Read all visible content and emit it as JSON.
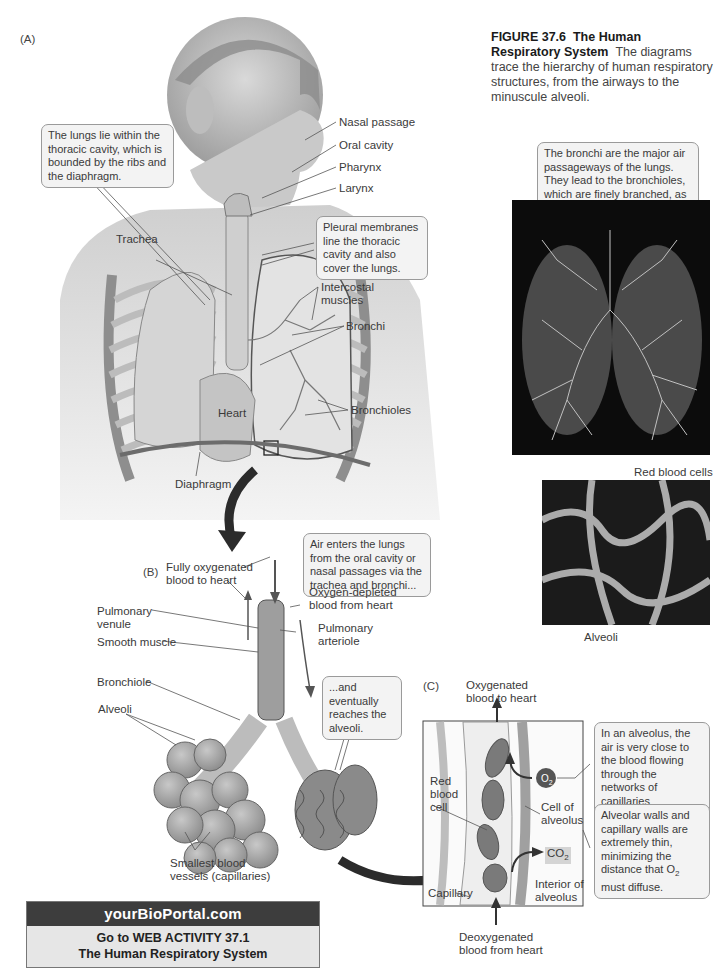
{
  "figure": {
    "number": "FIGURE 37.6",
    "title": "The Human Respiratory System",
    "caption": "The diagrams trace the hierarchy of human respiratory structures, from the airways to the minuscule alveoli."
  },
  "panels": {
    "a": {
      "letter": "(A)",
      "labels": {
        "nasal_passage": "Nasal passage",
        "oral_cavity": "Oral cavity",
        "pharynx": "Pharynx",
        "larynx": "Larynx",
        "trachea": "Trachea",
        "intercostal_1": "Intercostal",
        "intercostal_2": "muscles",
        "bronchi": "Bronchi",
        "heart": "Heart",
        "bronchioles": "Bronchioles",
        "diaphragm": "Diaphragm"
      },
      "callouts": {
        "thoracic": "The lungs lie within the thoracic cavity, which is bounded by the ribs and the diaphragm.",
        "pleural": "Pleural membranes line the thoracic cavity and also cover the lungs."
      }
    },
    "photos": {
      "bronchi_callout": "The bronchi are the major air passageways of the lungs. They lead to the bronchioles, which are finely branched, as are the blood vessels.",
      "red_blood_cells": "Red blood cells",
      "alveoli": "Alveoli"
    },
    "b": {
      "letter": "(B)",
      "labels": {
        "fully_oxy_1": "Fully oxygenated",
        "fully_oxy_2": "blood to heart",
        "oxy_depleted_1": "Oxygen-depleted",
        "oxy_depleted_2": "blood from heart",
        "pulm_venule_1": "Pulmonary",
        "pulm_venule_2": "venule",
        "pulm_arteriole_1": "Pulmonary",
        "pulm_arteriole_2": "arteriole",
        "smooth_muscle": "Smooth muscle",
        "bronchiole": "Bronchiole",
        "alveoli": "Alveoli",
        "smallest_1": "Smallest blood",
        "smallest_2": "vessels (capillaries)"
      },
      "callouts": {
        "air_enters": "Air enters the lungs from the oral cavity or nasal passages via the trachea and bronchi...",
        "eventually": "...and eventually reaches the alveoli."
      }
    },
    "c": {
      "letter": "(C)",
      "labels": {
        "oxygenated_1": "Oxygenated",
        "oxygenated_2": "blood to heart",
        "red_1": "Red",
        "red_2": "blood",
        "red_3": "cell",
        "cell_of_1": "Cell of",
        "cell_of_2": "alveolus",
        "capillary": "Capillary",
        "interior_1": "Interior of",
        "interior_2": "alveolus",
        "deoxy_1": "Deoxygenated",
        "deoxy_2": "blood from heart",
        "o2": "O",
        "o2_sub": "2",
        "co2": "CO",
        "co2_sub": "2"
      },
      "callouts": {
        "alveolus": "In an alveolus, the air is very close to the blood flowing through the networks of capillaries surrounding the alveoli.",
        "walls_pre": "Alveolar walls and capillary walls are extremely thin, minimizing the distance that O",
        "walls_sub": "2",
        "walls_post": " must diffuse."
      }
    }
  },
  "portal": {
    "site": "yourBioPortal.com",
    "line1": "Go to WEB ACTIVITY 37.1",
    "line2": "The Human Respiratory System"
  }
}
